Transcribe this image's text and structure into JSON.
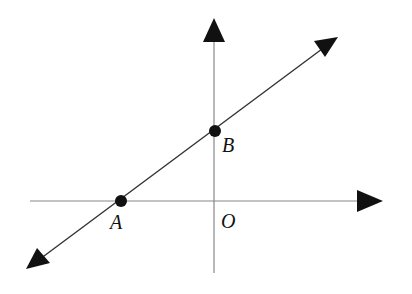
{
  "figure": {
    "colors": {
      "axis": "#777777",
      "line": "#333333",
      "point": "#111111",
      "arrow": "#111111",
      "background": "#ffffff"
    },
    "origin_label": "O",
    "points": [
      {
        "id": "A",
        "label": "A",
        "location": "negative x-axis"
      },
      {
        "id": "B",
        "label": "B",
        "location": "positive y-axis"
      }
    ]
  }
}
